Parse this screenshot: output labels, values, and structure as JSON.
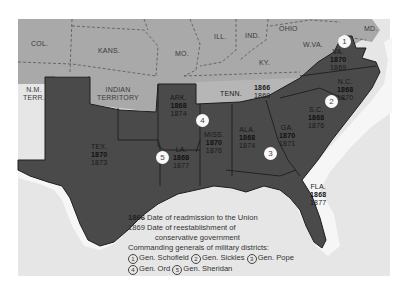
{
  "colors": {
    "background": "#ffffff",
    "water": "#e6e6e6",
    "coast_halo": "#f7f7f7",
    "union_states": "#a9a9a9",
    "confederate_states": "#4a4a4a",
    "tennessee": "#b4b4b4",
    "borders": "#262626"
  },
  "states": {
    "col": {
      "name": "COL."
    },
    "kans": {
      "name": "KANS."
    },
    "mo": {
      "name": "MO."
    },
    "ill": {
      "name": "ILL."
    },
    "ind": {
      "name": "IND."
    },
    "ohio": {
      "name": "OHIO"
    },
    "wva": {
      "name": "W.VA."
    },
    "md": {
      "name": "MD."
    },
    "ky": {
      "name": "KY."
    },
    "nm": {
      "name": "N.M.\nTERR."
    },
    "nm_line1": "N.M.",
    "nm_line2": "TERR.",
    "indian_line1": "INDIAN",
    "indian_line2": "TERRITORY",
    "tenn": {
      "name": "TENN.",
      "readmission": "1866",
      "conservative": "1869"
    },
    "va": {
      "name": "VA.",
      "readmission": "1870",
      "conservative": "1869"
    },
    "nc": {
      "name": "N.C.",
      "readmission": "1868",
      "conservative": "1870"
    },
    "sc": {
      "name": "S.C.",
      "readmission": "1868",
      "conservative": "1876"
    },
    "ga": {
      "name": "GA.",
      "readmission": "1870",
      "conservative": "1871"
    },
    "ala": {
      "name": "ALA.",
      "readmission": "1868",
      "conservative": "1874"
    },
    "miss": {
      "name": "MISS.",
      "readmission": "1870",
      "conservative": "1876"
    },
    "ark": {
      "name": "ARK.",
      "readmission": "1868",
      "conservative": "1874"
    },
    "la": {
      "name": "LA.",
      "readmission": "1868",
      "conservative": "1877"
    },
    "tex": {
      "name": "TEX.",
      "readmission": "1870",
      "conservative": "1873"
    },
    "fla": {
      "name": "FLA.",
      "readmission": "1868",
      "conservative": "1877"
    }
  },
  "district_markers": [
    {
      "number": "1",
      "state": "VA."
    },
    {
      "number": "2",
      "state": "S.C."
    },
    {
      "number": "3",
      "state": "ALA."
    },
    {
      "number": "4",
      "state": "ARK."
    },
    {
      "number": "5",
      "state": "LA."
    }
  ],
  "legend": {
    "readmission_sample": "1866",
    "readmission_text": "Date of readmission to the Union",
    "conservative_sample": "1869",
    "conservative_text_1": "Date of reestablishment of",
    "conservative_text_2": "conservative government",
    "generals_heading": "Commanding generals of military districts:",
    "generals": [
      {
        "number": "1",
        "name": "Gen. Schofield"
      },
      {
        "number": "2",
        "name": "Gen. Sickles"
      },
      {
        "number": "3",
        "name": "Gen. Pope"
      },
      {
        "number": "4",
        "name": "Gen. Ord"
      },
      {
        "number": "5",
        "name": "Gen. Sheridan"
      }
    ]
  }
}
